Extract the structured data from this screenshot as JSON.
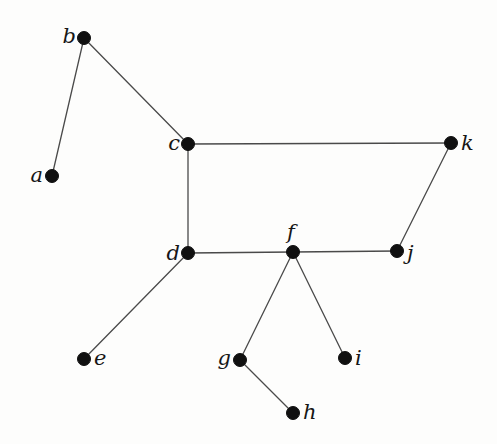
{
  "graph": {
    "type": "undirected-graph",
    "node_radius": 6.5,
    "colors": {
      "node_fill": "#101010",
      "edge_stroke": "#4a4a4a",
      "label_color": "#161616",
      "background": "#fdfdfc"
    },
    "nodes": [
      {
        "id": "a",
        "label": "a",
        "x": 52,
        "y": 176,
        "label_anchor": "end",
        "label_dx": -9,
        "label_dy": 6
      },
      {
        "id": "b",
        "label": "b",
        "x": 84,
        "y": 38,
        "label_anchor": "end",
        "label_dx": -8,
        "label_dy": 5
      },
      {
        "id": "c",
        "label": "c",
        "x": 188,
        "y": 144,
        "label_anchor": "end",
        "label_dx": -8,
        "label_dy": 6
      },
      {
        "id": "d",
        "label": "d",
        "x": 188,
        "y": 253,
        "label_anchor": "end",
        "label_dx": -8,
        "label_dy": 7
      },
      {
        "id": "e",
        "label": "e",
        "x": 84,
        "y": 359,
        "label_anchor": "start",
        "label_dx": 10,
        "label_dy": 6
      },
      {
        "id": "f",
        "label": "f",
        "x": 293,
        "y": 252,
        "label_anchor": "middle",
        "label_dx": -2,
        "label_dy": -13
      },
      {
        "id": "g",
        "label": "g",
        "x": 240,
        "y": 360,
        "label_anchor": "end",
        "label_dx": -9,
        "label_dy": 5
      },
      {
        "id": "h",
        "label": "h",
        "x": 293,
        "y": 413,
        "label_anchor": "start",
        "label_dx": 10,
        "label_dy": 6
      },
      {
        "id": "i",
        "label": "i",
        "x": 345,
        "y": 358,
        "label_anchor": "start",
        "label_dx": 10,
        "label_dy": 7
      },
      {
        "id": "j",
        "label": "j",
        "x": 397,
        "y": 251,
        "label_anchor": "start",
        "label_dx": 10,
        "label_dy": 9
      },
      {
        "id": "k",
        "label": "k",
        "x": 451,
        "y": 143,
        "label_anchor": "start",
        "label_dx": 10,
        "label_dy": 7
      }
    ],
    "edges": [
      {
        "from": "a",
        "to": "b"
      },
      {
        "from": "b",
        "to": "c"
      },
      {
        "from": "c",
        "to": "d"
      },
      {
        "from": "c",
        "to": "k"
      },
      {
        "from": "d",
        "to": "e"
      },
      {
        "from": "d",
        "to": "f"
      },
      {
        "from": "f",
        "to": "g"
      },
      {
        "from": "f",
        "to": "i"
      },
      {
        "from": "f",
        "to": "j"
      },
      {
        "from": "g",
        "to": "h"
      },
      {
        "from": "j",
        "to": "k"
      }
    ]
  }
}
